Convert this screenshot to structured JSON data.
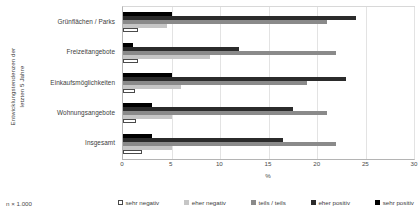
{
  "chart_data": {
    "type": "bar",
    "orientation": "horizontal",
    "title": "",
    "xlabel": "%",
    "ylabel": "Entwicklungstendenzen der\nletzten 5 Jahre",
    "xlim": [
      0,
      30
    ],
    "xticks": [
      0,
      5,
      10,
      15,
      20,
      25,
      30
    ],
    "grid": true,
    "legend_position": "bottom",
    "note": "n × 1.000",
    "categories": [
      "Grünflächen / Parks",
      "Freizeitangebote",
      "Einkaufsmöglichkeiten",
      "Wohnungsangebote",
      "Insgesamt"
    ],
    "series": [
      {
        "name": "sehr negativ",
        "color": "#ffffff",
        "values": [
          1.5,
          1.5,
          1.2,
          1.3,
          2.0
        ]
      },
      {
        "name": "eher negativ",
        "color": "#c6c6c6",
        "values": [
          4.5,
          9.0,
          6.0,
          5.0,
          5.0
        ]
      },
      {
        "name": "teils / teils",
        "color": "#8a8a8a",
        "values": [
          21.0,
          22.0,
          19.0,
          21.0,
          22.0
        ]
      },
      {
        "name": "eher positiv",
        "color": "#2b2b2b",
        "values": [
          24.0,
          12.0,
          23.0,
          17.5,
          16.5
        ]
      },
      {
        "name": "sehr positiv",
        "color": "#000000",
        "values": [
          5.0,
          1.0,
          5.0,
          3.0,
          3.0
        ]
      }
    ]
  }
}
